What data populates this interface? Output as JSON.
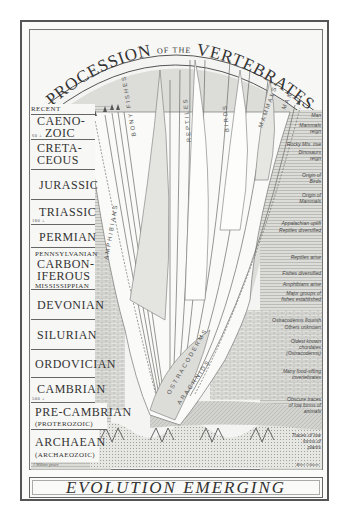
{
  "title": {
    "part1": "PROCESSION",
    "part2": "OF THE",
    "part3": "VERTEBRATES"
  },
  "caption": "EVOLUTION EMERGING",
  "colors": {
    "ink": "#333333",
    "paper": "#f4f4f2",
    "shade": "#c8c8c4",
    "frame": "#555555"
  },
  "eras": [
    {
      "name": "RECENT",
      "sub": "",
      "ma": ""
    },
    {
      "name": "CAENOZOIC",
      "name_lines": [
        "CAENO-",
        "ZOIC"
      ],
      "ma": "60 ±"
    },
    {
      "name": "CRETACEOUS",
      "name_lines": [
        "CRETA-",
        "CEOUS"
      ],
      "ma": ""
    },
    {
      "name": "JURASSIC",
      "ma": ""
    },
    {
      "name": "TRIASSIC",
      "ma": "180 ±"
    },
    {
      "name": "PERMIAN",
      "ma": ""
    },
    {
      "name": "CARBONIFEROUS",
      "name_lines": [
        "CARBON-",
        "IFEROUS"
      ],
      "sub_top": "PENNSYLVANIAN",
      "sub_bottom": "MISSISSIPPIAN"
    },
    {
      "name": "DEVONIAN"
    },
    {
      "name": "SILURIAN"
    },
    {
      "name": "ORDOVICIAN"
    },
    {
      "name": "CAMBRIAN",
      "ma": "500 ±"
    },
    {
      "name": "PRE-CAMBRIAN",
      "sub": "(PROTEROZOIC)"
    },
    {
      "name": "ARCHAEAN",
      "sub": "(ARCHAEOZOIC)"
    }
  ],
  "notes": [
    "Man",
    "Mammals reign",
    "Rocky Mts. rise",
    "Dinosaurs reign",
    "Origin of Birds",
    "Origin of Mammals",
    "Appalachian uplift",
    "Reptiles diversified",
    "Reptiles arise",
    "Fishes diversified",
    "Amphibians arise",
    "Major groups of fishes established",
    "Ostracoderms flourish",
    "Others unknown",
    "Oldest known chordates (Ostracoderms)",
    "Many food-sifting invertebrates",
    "Obscure traces of low forms of animals",
    "Traces of low forms of plants"
  ],
  "branches": {
    "bony_fishes": "BONY FISHES",
    "reptiles": "REPTILES",
    "birds": "BIRDS",
    "mammals": "MAMMALS",
    "man": "MAN",
    "amphibians": "AMPHIBIANS",
    "ostracoderms": "OSTRACODERMS",
    "arachnids": "ARACHNIDS"
  },
  "credits": {
    "left": "# Million years",
    "right": "After Osborn"
  }
}
